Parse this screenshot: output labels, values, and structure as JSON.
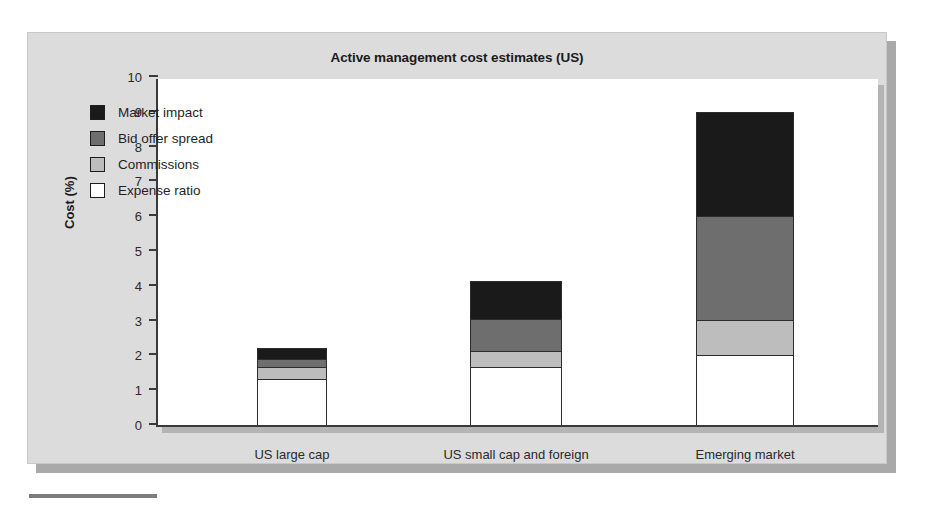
{
  "figure": {
    "title": "Active management cost estimates (US)",
    "background_color": "#dcdcdc",
    "plot_background_color": "#ffffff"
  },
  "chart_data": {
    "type": "bar",
    "stacked": true,
    "title": "Active management cost estimates (US)",
    "xlabel": "",
    "ylabel": "Cost (%)",
    "ylim": [
      0,
      10
    ],
    "yticks": [
      0,
      1,
      2,
      3,
      4,
      5,
      6,
      7,
      8,
      9,
      10
    ],
    "ytick_labels": [
      "0",
      "1",
      "2",
      "3",
      "4",
      "5",
      "6",
      "7",
      "8",
      "9",
      "10"
    ],
    "grid": false,
    "legend_position": "upper left",
    "categories": [
      "US large cap",
      "US small cap and foreign",
      "Emerging market"
    ],
    "series": [
      {
        "name": "Expense ratio",
        "color": "#ffffff",
        "values": [
          1.3,
          1.65,
          2.0
        ]
      },
      {
        "name": "Commissions",
        "color": "#bdbdbd",
        "values": [
          0.35,
          0.45,
          1.0
        ]
      },
      {
        "name": "Bid offer spread",
        "color": "#6e6e6e",
        "values": [
          0.25,
          0.95,
          3.0
        ]
      },
      {
        "name": "Market impact",
        "color": "#1a1a1a",
        "values": [
          0.32,
          1.1,
          3.0
        ]
      }
    ],
    "totals": [
      2.22,
      4.15,
      9.0
    ]
  },
  "legend": {
    "items": [
      {
        "label": "Market impact",
        "color": "#1a1a1a"
      },
      {
        "label": "Bid offer spread",
        "color": "#6e6e6e"
      },
      {
        "label": "Commissions",
        "color": "#bdbdbd"
      },
      {
        "label": "Expense ratio",
        "color": "#ffffff"
      }
    ]
  }
}
